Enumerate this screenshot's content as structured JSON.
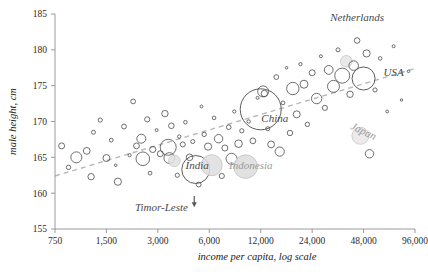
{
  "chart_data": {
    "type": "scatter",
    "title": "",
    "xlabel": "income per capita, log scale",
    "ylabel": "male height, cm",
    "xscale": "log2",
    "xticks": [
      750,
      1500,
      3000,
      6000,
      12000,
      24000,
      48000,
      96000
    ],
    "xtick_labels": [
      "750",
      "1,500",
      "3,000",
      "6,000",
      "12,000",
      "24,000",
      "48,000",
      "96,000"
    ],
    "xlim": [
      750,
      96000
    ],
    "yticks": [
      155,
      160,
      165,
      170,
      175,
      180,
      185
    ],
    "ytick_labels": [
      "155",
      "160",
      "165",
      "170",
      "175",
      "180",
      "185"
    ],
    "ylim": [
      155,
      185
    ],
    "grid": false,
    "legend": "none",
    "size_encoding": "population",
    "trend_line": {
      "style": "dashed",
      "color": "#b9b9b9",
      "x_start": 750,
      "y_start": 162.4,
      "x_end": 96000,
      "y_end": 177.4
    },
    "annotations": [
      {
        "label": "Netherlands",
        "x": 44000,
        "y": 184.0,
        "style": "dark"
      },
      {
        "label": "USA",
        "x": 72000,
        "y": 176.3,
        "style": "dark"
      },
      {
        "label": "Japan",
        "x": 47000,
        "y": 168.2,
        "style": "light"
      },
      {
        "label": "China",
        "x": 14500,
        "y": 170.0,
        "style": "dark"
      },
      {
        "label": "India",
        "x": 5100,
        "y": 163.4,
        "style": "dark"
      },
      {
        "label": "Indonesia",
        "x": 10500,
        "y": 163.4,
        "style": "light"
      },
      {
        "label": "Timor-Leste",
        "x": 3150,
        "y": 157.5,
        "style": "dark"
      }
    ],
    "arrow": {
      "from_x": 4900,
      "from_y": 159.6,
      "to_x": 4900,
      "to_y": 158.6,
      "points": "down"
    },
    "points": [
      {
        "x": 820,
        "y": 166.6,
        "r": 3.0,
        "fill": "none"
      },
      {
        "x": 900,
        "y": 163.6,
        "r": 2.2,
        "fill": "none"
      },
      {
        "x": 1000,
        "y": 165.0,
        "r": 5.5,
        "fill": "none"
      },
      {
        "x": 1150,
        "y": 165.9,
        "r": 3.4,
        "fill": "none"
      },
      {
        "x": 1220,
        "y": 162.3,
        "r": 3.2,
        "fill": "none"
      },
      {
        "x": 1260,
        "y": 168.5,
        "r": 2.0,
        "fill": "none"
      },
      {
        "x": 1380,
        "y": 170.2,
        "r": 2.1,
        "fill": "none"
      },
      {
        "x": 1500,
        "y": 164.9,
        "r": 3.5,
        "fill": "none"
      },
      {
        "x": 1600,
        "y": 167.4,
        "r": 1.9,
        "fill": "none"
      },
      {
        "x": 1700,
        "y": 163.9,
        "r": 1.3,
        "fill": "none"
      },
      {
        "x": 1750,
        "y": 161.6,
        "r": 3.6,
        "fill": "none"
      },
      {
        "x": 1900,
        "y": 169.3,
        "r": 2.4,
        "fill": "none"
      },
      {
        "x": 2050,
        "y": 165.3,
        "r": 1.6,
        "fill": "none"
      },
      {
        "x": 2150,
        "y": 172.8,
        "r": 2.4,
        "fill": "none"
      },
      {
        "x": 2250,
        "y": 166.6,
        "r": 2.9,
        "fill": "none"
      },
      {
        "x": 2400,
        "y": 167.6,
        "r": 4.5,
        "fill": "none"
      },
      {
        "x": 2450,
        "y": 164.8,
        "r": 6.8,
        "fill": "none"
      },
      {
        "x": 2600,
        "y": 170.3,
        "r": 2.6,
        "fill": "none"
      },
      {
        "x": 2700,
        "y": 162.8,
        "r": 1.9,
        "fill": "none"
      },
      {
        "x": 2800,
        "y": 166.1,
        "r": 3.1,
        "fill": "none"
      },
      {
        "x": 2950,
        "y": 168.8,
        "r": 1.5,
        "fill": "none"
      },
      {
        "x": 3100,
        "y": 165.5,
        "r": 3.0,
        "fill": "none"
      },
      {
        "x": 3300,
        "y": 171.1,
        "r": 3.2,
        "fill": "none"
      },
      {
        "x": 3450,
        "y": 166.4,
        "r": 8.0,
        "fill": "none"
      },
      {
        "x": 3500,
        "y": 164.9,
        "r": 5.4,
        "fill": "none"
      },
      {
        "x": 3600,
        "y": 169.4,
        "r": 2.8,
        "fill": "none"
      },
      {
        "x": 3750,
        "y": 164.5,
        "r": 5.8,
        "fill": "#e0e0e0"
      },
      {
        "x": 3900,
        "y": 162.5,
        "r": 2.1,
        "fill": "none"
      },
      {
        "x": 4000,
        "y": 167.9,
        "r": 1.7,
        "fill": "none"
      },
      {
        "x": 4200,
        "y": 166.8,
        "r": 2.5,
        "fill": "none"
      },
      {
        "x": 4350,
        "y": 169.9,
        "r": 1.8,
        "fill": "none"
      },
      {
        "x": 4600,
        "y": 165.0,
        "r": 3.3,
        "fill": "none"
      },
      {
        "x": 4800,
        "y": 167.2,
        "r": 2.0,
        "fill": "none"
      },
      {
        "x": 5000,
        "y": 163.3,
        "r": 14.0,
        "fill": "none"
      },
      {
        "x": 5200,
        "y": 161.2,
        "r": 2.4,
        "fill": "none"
      },
      {
        "x": 5400,
        "y": 172.1,
        "r": 1.4,
        "fill": "none"
      },
      {
        "x": 5600,
        "y": 168.2,
        "r": 2.2,
        "fill": "none"
      },
      {
        "x": 5900,
        "y": 166.5,
        "r": 3.6,
        "fill": "none"
      },
      {
        "x": 6200,
        "y": 163.9,
        "r": 10.5,
        "fill": "#dedede"
      },
      {
        "x": 6400,
        "y": 170.5,
        "r": 1.8,
        "fill": "none"
      },
      {
        "x": 6800,
        "y": 167.6,
        "r": 4.2,
        "fill": "none"
      },
      {
        "x": 7100,
        "y": 162.4,
        "r": 2.6,
        "fill": "none"
      },
      {
        "x": 7400,
        "y": 166.3,
        "r": 3.0,
        "fill": "none"
      },
      {
        "x": 7800,
        "y": 169.2,
        "r": 2.3,
        "fill": "none"
      },
      {
        "x": 8100,
        "y": 164.8,
        "r": 5.5,
        "fill": "none"
      },
      {
        "x": 8400,
        "y": 171.4,
        "r": 1.6,
        "fill": "none"
      },
      {
        "x": 8900,
        "y": 166.9,
        "r": 3.8,
        "fill": "none"
      },
      {
        "x": 9300,
        "y": 168.7,
        "r": 2.1,
        "fill": "none"
      },
      {
        "x": 9800,
        "y": 163.7,
        "r": 11.8,
        "fill": "#dcdcdc"
      },
      {
        "x": 10200,
        "y": 170.0,
        "r": 1.7,
        "fill": "none"
      },
      {
        "x": 10800,
        "y": 167.3,
        "r": 2.9,
        "fill": "none"
      },
      {
        "x": 11500,
        "y": 173.3,
        "r": 1.5,
        "fill": "none"
      },
      {
        "x": 12000,
        "y": 171.7,
        "r": 20.5,
        "fill": "none"
      },
      {
        "x": 12400,
        "y": 174.2,
        "r": 5.5,
        "fill": "none"
      },
      {
        "x": 12600,
        "y": 173.9,
        "r": 3.2,
        "fill": "none"
      },
      {
        "x": 13200,
        "y": 169.0,
        "r": 2.0,
        "fill": "none"
      },
      {
        "x": 13800,
        "y": 166.8,
        "r": 3.4,
        "fill": "none"
      },
      {
        "x": 14800,
        "y": 176.2,
        "r": 2.4,
        "fill": "none"
      },
      {
        "x": 15500,
        "y": 165.8,
        "r": 4.6,
        "fill": "none"
      },
      {
        "x": 16200,
        "y": 172.6,
        "r": 1.9,
        "fill": "none"
      },
      {
        "x": 17000,
        "y": 177.5,
        "r": 1.3,
        "fill": "none"
      },
      {
        "x": 17800,
        "y": 168.4,
        "r": 2.7,
        "fill": "none"
      },
      {
        "x": 18500,
        "y": 174.6,
        "r": 6.2,
        "fill": "none"
      },
      {
        "x": 19500,
        "y": 171.0,
        "r": 3.5,
        "fill": "none"
      },
      {
        "x": 20500,
        "y": 178.0,
        "r": 1.6,
        "fill": "none"
      },
      {
        "x": 21500,
        "y": 175.2,
        "r": 4.0,
        "fill": "none"
      },
      {
        "x": 22500,
        "y": 169.6,
        "r": 2.2,
        "fill": "none"
      },
      {
        "x": 24000,
        "y": 176.8,
        "r": 3.0,
        "fill": "none"
      },
      {
        "x": 25500,
        "y": 173.2,
        "r": 5.2,
        "fill": "none"
      },
      {
        "x": 27000,
        "y": 179.1,
        "r": 1.5,
        "fill": "none"
      },
      {
        "x": 28500,
        "y": 171.9,
        "r": 2.6,
        "fill": "none"
      },
      {
        "x": 30000,
        "y": 177.2,
        "r": 4.4,
        "fill": "none"
      },
      {
        "x": 32000,
        "y": 174.9,
        "r": 6.0,
        "fill": "none"
      },
      {
        "x": 34000,
        "y": 180.0,
        "r": 2.0,
        "fill": "none"
      },
      {
        "x": 36000,
        "y": 176.4,
        "r": 7.5,
        "fill": "none"
      },
      {
        "x": 38000,
        "y": 178.4,
        "r": 5.8,
        "fill": "#e5e5e5"
      },
      {
        "x": 40000,
        "y": 173.8,
        "r": 3.2,
        "fill": "none"
      },
      {
        "x": 42000,
        "y": 177.8,
        "r": 4.8,
        "fill": "none"
      },
      {
        "x": 44000,
        "y": 181.3,
        "r": 2.8,
        "fill": "none"
      },
      {
        "x": 46000,
        "y": 168.0,
        "r": 8.5,
        "fill": "#e8e8e8"
      },
      {
        "x": 48000,
        "y": 176.0,
        "r": 11.5,
        "fill": "none"
      },
      {
        "x": 50000,
        "y": 179.5,
        "r": 3.6,
        "fill": "none"
      },
      {
        "x": 52000,
        "y": 165.5,
        "r": 4.2,
        "fill": "none"
      },
      {
        "x": 56000,
        "y": 174.4,
        "r": 2.1,
        "fill": "none"
      },
      {
        "x": 60000,
        "y": 178.8,
        "r": 1.8,
        "fill": "none"
      },
      {
        "x": 66000,
        "y": 171.4,
        "r": 1.4,
        "fill": "none"
      },
      {
        "x": 72000,
        "y": 180.5,
        "r": 1.5,
        "fill": "none"
      },
      {
        "x": 80000,
        "y": 173.0,
        "r": 1.2,
        "fill": "none"
      },
      {
        "x": 88000,
        "y": 177.0,
        "r": 1.3,
        "fill": "none"
      }
    ]
  }
}
